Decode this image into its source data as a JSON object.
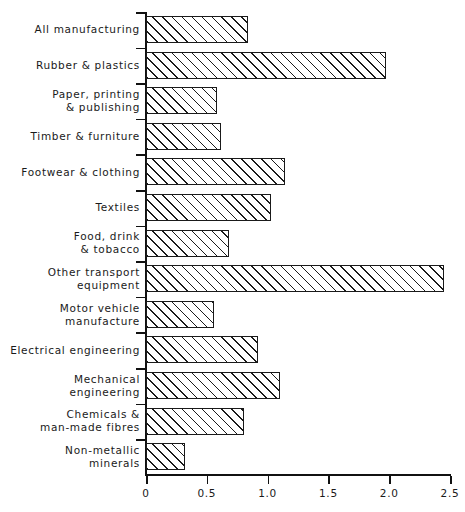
{
  "chart_data": {
    "type": "bar",
    "orientation": "horizontal",
    "title": "",
    "subtitle": "",
    "xlabel": "",
    "ylabel": "",
    "xlim": [
      0,
      2.5
    ],
    "xticks": [
      "0",
      "0.5",
      "1.0",
      "1.5",
      "2.0",
      "2.5"
    ],
    "xtick_values": [
      0,
      0.5,
      1.0,
      1.5,
      2.0,
      2.5
    ],
    "grid": false,
    "legend": false,
    "bar_style": "hatched-diagonal",
    "categories": [
      "All manufacturing",
      "Rubber & plastics",
      "Paper, printing\n& publishing",
      "Timber & furniture",
      "Footwear & clothing",
      "Textiles",
      "Food, drink\n& tobacco",
      "Other transport\nequipment",
      "Motor vehicle\nmanufacture",
      "Electrical engineering",
      "Mechanical\nengineering",
      "Chemicals &\nman-made fibres",
      "Non-metallic\nminerals"
    ],
    "values": [
      0.84,
      1.97,
      0.58,
      0.62,
      1.14,
      1.03,
      0.68,
      2.45,
      0.56,
      0.92,
      1.1,
      0.81,
      0.32
    ],
    "rows": [
      {
        "label_line1": "All manufacturing",
        "label_line2": "",
        "value": 0.84
      },
      {
        "label_line1": "Rubber & plastics",
        "label_line2": "",
        "value": 1.97
      },
      {
        "label_line1": "Paper, printing",
        "label_line2": "& publishing",
        "value": 0.58
      },
      {
        "label_line1": "Timber & furniture",
        "label_line2": "",
        "value": 0.62
      },
      {
        "label_line1": "Footwear & clothing",
        "label_line2": "",
        "value": 1.14
      },
      {
        "label_line1": "Textiles",
        "label_line2": "",
        "value": 1.03
      },
      {
        "label_line1": "Food, drink",
        "label_line2": "& tobacco",
        "value": 0.68
      },
      {
        "label_line1": "Other transport",
        "label_line2": "equipment",
        "value": 2.45
      },
      {
        "label_line1": "Motor vehicle",
        "label_line2": "manufacture",
        "value": 0.56
      },
      {
        "label_line1": "Electrical engineering",
        "label_line2": "",
        "value": 0.92
      },
      {
        "label_line1": "Mechanical",
        "label_line2": "engineering",
        "value": 1.1
      },
      {
        "label_line1": "Chemicals &",
        "label_line2": "man-made fibres",
        "value": 0.81
      },
      {
        "label_line1": "Non-metallic",
        "label_line2": "minerals",
        "value": 0.32
      }
    ],
    "colors": {
      "bar_fill": "#ffffff",
      "bar_edge": "#1a1a1a",
      "hatch": "#1a1a1a",
      "axis": "#111111",
      "text": "#1a1a1a",
      "background": "#ffffff"
    }
  }
}
